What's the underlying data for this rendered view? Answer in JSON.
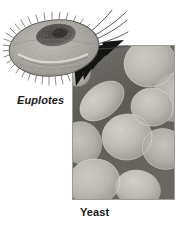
{
  "figure": {
    "background_color": "#ffffff",
    "width": 188,
    "height": 225,
    "style": "grayscale scientific micrograph plate"
  },
  "organisms": {
    "euplotes": {
      "label": "Euplotes",
      "label_style": "bold-italic",
      "description": "ciliate protozoan cell, oval body with granular cytoplasm, fringe of cilia along left and lower margin, long cirri projecting to upper right",
      "body_color": "#a8a6a2",
      "nucleus_color": "#3c3a38",
      "outline_color": "#55514d"
    },
    "yeast": {
      "label": "Yeast",
      "label_style": "bold",
      "description": "electron micrograph of clustered oval yeast cells, light cells against dark matrix",
      "cell_color": "#b8b5ad",
      "background_color": "#5e5c58",
      "panel_border_color": "#8d8a85"
    }
  },
  "connector": {
    "name": "magnification-wedges",
    "description": "dark tapering wedge pointers linking the Euplotes drawing to the yeast micrograph panel",
    "color": "#141414",
    "count": 4
  },
  "labels": {
    "euplotes": "Euplotes",
    "yeast": "Yeast"
  },
  "colors": {
    "ink": "#1a1a1a",
    "paper": "#ffffff",
    "dark_matrix": "#5e5c58",
    "light_cell": "#b8b5ad"
  }
}
